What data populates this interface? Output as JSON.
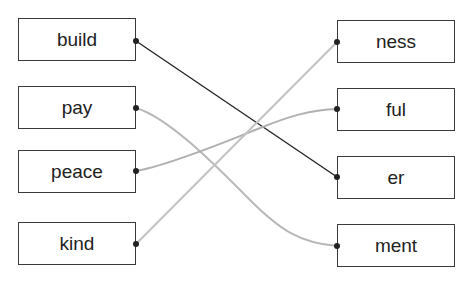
{
  "left_words": [
    "build",
    "pay",
    "peace",
    "kind"
  ],
  "right_words": [
    "ness",
    "ful",
    "er",
    "ment"
  ],
  "connections": [
    {
      "from": "build",
      "to": "er",
      "color": "#222222"
    },
    {
      "from": "pay",
      "to": "ment",
      "color": "#b5b5b5"
    },
    {
      "from": "peace",
      "to": "ful",
      "color": "#b0b0b0"
    },
    {
      "from": "kind",
      "to": "ness",
      "color": "#c0c0c0"
    }
  ]
}
